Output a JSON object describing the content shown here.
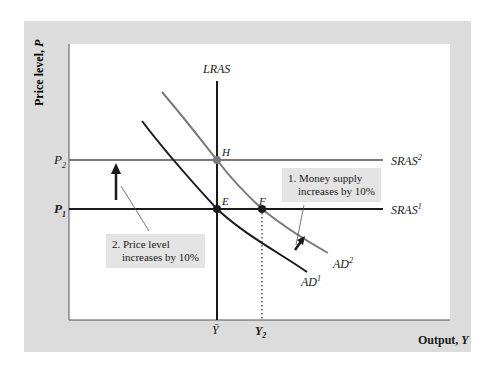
{
  "figure": {
    "y_axis_label": "Price level, ",
    "y_axis_var": "P",
    "x_axis_label": "Output, ",
    "x_axis_var": "Y",
    "y_ticks": [
      {
        "base": "P",
        "sub": "2"
      },
      {
        "base": "P",
        "sub": "1"
      }
    ],
    "x_ticks": [
      {
        "base": "Y",
        "bar": true,
        "label": "Ȳ"
      },
      {
        "base": "Y",
        "sub": "2"
      }
    ],
    "curves": {
      "lras": "LRAS",
      "sras2": {
        "base": "SRAS",
        "sup": "2"
      },
      "sras1": {
        "base": "SRAS",
        "sup": "1"
      },
      "ad2": {
        "base": "AD",
        "sup": "2"
      },
      "ad1": {
        "base": "AD",
        "sup": "1"
      }
    },
    "points": {
      "h": "H",
      "e": "E",
      "f": "F"
    },
    "annotations": {
      "money_supply": {
        "line1": "1. Money supply",
        "line2": "increases by 10%"
      },
      "price_level": {
        "line1": "2. Price level",
        "line2": "increases by 10%"
      }
    },
    "colors": {
      "panel": "#dcdcdc",
      "plot": "#ffffff",
      "black_line": "#1a1a1a",
      "gray_line": "#7a7a7a",
      "note_bg": "#e4e4e4"
    }
  }
}
